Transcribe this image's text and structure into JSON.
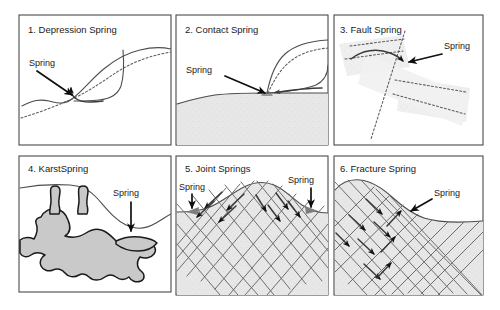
{
  "figure": {
    "title_text_present": false,
    "background_color": "#ffffff",
    "frame_color": "#4a4a4a",
    "layout": {
      "columns": 3,
      "rows": 2,
      "width": 500,
      "height": 310
    }
  },
  "panels": [
    {
      "id": "depression-spring",
      "number": "1.",
      "title": "1. Depression Spring",
      "labels": [
        {
          "text": "Spring",
          "name": "spring-label"
        }
      ],
      "shading": "none",
      "features": [
        "land-surface",
        "water-table-dashed",
        "depression-hollow",
        "flow-arrow"
      ]
    },
    {
      "id": "contact-spring",
      "number": "2.",
      "title": "2. Contact Spring",
      "labels": [
        {
          "text": "Spring",
          "name": "spring-label"
        }
      ],
      "shading": "impermeable-layer-gray",
      "features": [
        "land-surface",
        "permeable-unit",
        "water-table-dashed",
        "contact-arrows"
      ]
    },
    {
      "id": "fault-spring",
      "number": "3.",
      "title": "3. Fault Spring",
      "labels": [
        {
          "text": "Spring",
          "name": "spring-label"
        }
      ],
      "shading": "aquifer-band-gray",
      "features": [
        "dipping-aquifer-band",
        "fault-plane-dashed",
        "curved-flow-arrow"
      ]
    },
    {
      "id": "karst-spring",
      "number": "4.",
      "title": "4. KarstSpring",
      "labels": [
        {
          "text": "Spring",
          "name": "spring-label"
        }
      ],
      "shading": "cave-network-gray",
      "features": [
        "land-surface",
        "sinkholes",
        "dissolution-cavities",
        "spring-outlet",
        "down-arrow"
      ]
    },
    {
      "id": "joint-springs",
      "number": "5.",
      "title": "5. Joint Springs",
      "labels": [
        {
          "text": "Spring",
          "name": "spring-label-left"
        },
        {
          "text": "Spring",
          "name": "spring-label-right"
        }
      ],
      "shading": "rock-mass-gray",
      "features": [
        "hill-surface",
        "joint-set-a",
        "joint-set-b",
        "convergent-flow-arrows",
        "two-spring-outlets"
      ]
    },
    {
      "id": "fracture-spring",
      "number": "6.",
      "title": "6. Fracture Spring",
      "labels": [
        {
          "text": "Spring",
          "name": "spring-label"
        }
      ],
      "shading": "rock-mass-gray",
      "features": [
        "slope-surface",
        "fracture-set-a",
        "fracture-set-b",
        "flow-arrows"
      ]
    }
  ],
  "colors": {
    "shade_light": "#e9e9e9",
    "shade_medium": "#d5d5d5",
    "karst_fill": "#c9c9c9",
    "line_dark": "#1a1a1a",
    "line_mid": "#4d4d4d",
    "joint": "#6d6d6d",
    "arrow_gray": "#7d7d7d"
  }
}
